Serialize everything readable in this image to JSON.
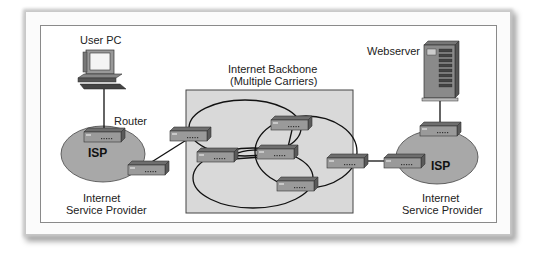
{
  "diagram": {
    "type": "network-topology",
    "labels": {
      "user_pc": "User PC",
      "router": "Router",
      "isp_left": "ISP",
      "isp_left_caption_line1": "Internet",
      "isp_left_caption_line2": "Service Provider",
      "backbone_line1": "Internet Backbone",
      "backbone_line2": "(Multiple Carriers)",
      "webserver": "Webserver",
      "isp_right": "ISP",
      "isp_right_caption_line1": "Internet",
      "isp_right_caption_line2": "Service Provider"
    },
    "colors": {
      "isp_fill": "#a8a8a8",
      "backbone_fill": "#d9d9d9",
      "router_body": "#8f8f8f",
      "router_top": "#6e6e6e",
      "line": "#111111"
    },
    "nodes": [
      {
        "id": "user-pc",
        "kind": "computer"
      },
      {
        "id": "isp-left-router-top",
        "kind": "router"
      },
      {
        "id": "isp-left-router-edge",
        "kind": "router"
      },
      {
        "id": "backbone-r1",
        "kind": "router"
      },
      {
        "id": "backbone-r2",
        "kind": "router"
      },
      {
        "id": "backbone-r3",
        "kind": "router"
      },
      {
        "id": "backbone-r4",
        "kind": "router"
      },
      {
        "id": "backbone-r5",
        "kind": "router"
      },
      {
        "id": "backbone-r6",
        "kind": "router"
      },
      {
        "id": "isp-right-router-edge",
        "kind": "router"
      },
      {
        "id": "isp-right-router-top",
        "kind": "router"
      },
      {
        "id": "webserver",
        "kind": "server"
      }
    ]
  }
}
